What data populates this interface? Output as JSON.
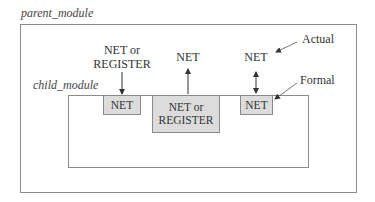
{
  "diagram": {
    "type": "module-port-connection-rules",
    "parent_module": {
      "label": "parent_module"
    },
    "child_module": {
      "label": "child_module"
    },
    "actual_label": "Actual",
    "formal_label": "Formal",
    "external_signals": [
      {
        "line1": "NET or",
        "line2": "REGISTER",
        "direction": "input",
        "arrow": "down"
      },
      {
        "line1": "NET",
        "direction": "output",
        "arrow": "up"
      },
      {
        "line1": "NET",
        "direction": "inout",
        "arrow": "bidirectional"
      }
    ],
    "ports": [
      {
        "line1": "NET",
        "line2": ""
      },
      {
        "line1": "NET or",
        "line2": "REGISTER"
      },
      {
        "line1": "NET",
        "line2": ""
      }
    ],
    "colors": {
      "port_fill": "#dcdcdc",
      "border": "#8a8a8a",
      "text": "#333333"
    }
  }
}
